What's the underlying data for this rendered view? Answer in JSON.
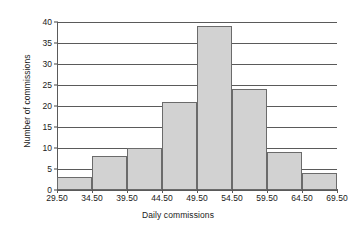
{
  "chart_data": {
    "type": "bar",
    "title": "",
    "xlabel": "Daily commissions",
    "ylabel": "Number of commissions",
    "categories": [
      "29.50-34.50",
      "34.50-39.50",
      "39.50-44.50",
      "44.50-49.50",
      "49.50-54.50",
      "54.50-59.50",
      "59.50-64.50",
      "64.50-69.50"
    ],
    "bin_edges": [
      29.5,
      34.5,
      39.5,
      44.5,
      49.5,
      54.5,
      59.5,
      64.5,
      69.5
    ],
    "values": [
      3,
      8,
      10,
      21,
      39,
      24,
      9,
      4
    ],
    "x_tick_labels": [
      "29.50",
      "34.50",
      "39.50",
      "44.50",
      "49.50",
      "54.50",
      "59.50",
      "64.50",
      "69.50"
    ],
    "y_tick_labels": [
      "0",
      "5",
      "10",
      "15",
      "20",
      "25",
      "30",
      "35",
      "40"
    ],
    "y_ticks": [
      0,
      5,
      10,
      15,
      20,
      25,
      30,
      35,
      40
    ],
    "ylim": [
      0,
      40
    ],
    "xlim": [
      29.5,
      69.5
    ],
    "grid": "horizontal",
    "legend": "none",
    "bar_fill_color": "#d2d2d2",
    "bar_border_color": "#6b6b6b",
    "axis_color": "#5a5a5a",
    "background_color": "#ffffff"
  }
}
